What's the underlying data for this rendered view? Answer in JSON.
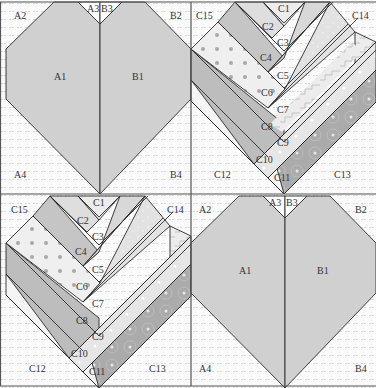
{
  "colors": {
    "background": "#fbfbfb",
    "dots": "#d2d2d2",
    "heart_fill": "#d0d0d0",
    "outline": "#2a2a2a",
    "strip_light": "#e8e8e8",
    "strip_lighter": "#f0f0f0",
    "strip_mid": "#cdcdcd",
    "strip_dark": "#b5b5b5",
    "strip_darkest": "#a8a8a8",
    "polka_dot": "#a0a0a0"
  },
  "blocks": [
    {
      "id": "top-left",
      "type": "A/B heart",
      "labels": {
        "A1": "A1",
        "A2": "A2",
        "A3": "A3",
        "A4": "A4",
        "B1": "B1",
        "B2": "B2",
        "B3": "B3",
        "B4": "B4"
      }
    },
    {
      "id": "top-right",
      "type": "C strip heart",
      "labels": {
        "C1": "C1",
        "C2": "C2",
        "C3": "C3",
        "C4": "C4",
        "C5": "C5",
        "C6": "C6",
        "C7": "C7",
        "C8": "C8",
        "C9": "C9",
        "C10": "C10",
        "C11": "C11",
        "C12": "C12",
        "C13": "C13",
        "C14": "C14",
        "C15": "C15"
      }
    },
    {
      "id": "bottom-left",
      "type": "C strip heart",
      "labels": {
        "C1": "C1",
        "C2": "C2",
        "C3": "C3",
        "C4": "C4",
        "C5": "C5",
        "C6": "C6",
        "C7": "C7",
        "C8": "C8",
        "C9": "C9",
        "C10": "C10",
        "C11": "C11",
        "C12": "C12",
        "C13": "C13",
        "C14": "C14",
        "C15": "C15"
      }
    },
    {
      "id": "bottom-right",
      "type": "A/B heart",
      "labels": {
        "A1": "A1",
        "A2": "A2",
        "A3": "A3",
        "A4": "A4",
        "B1": "B1",
        "B2": "B2",
        "B3": "B3",
        "B4": "B4"
      }
    }
  ]
}
